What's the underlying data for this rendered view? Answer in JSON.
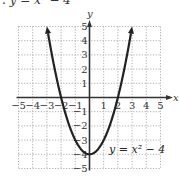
{
  "header": {
    "text": ". y = x² − 4"
  },
  "chart_data": {
    "type": "line",
    "title": "",
    "equation": "y = x² − 4",
    "xlabel": "x",
    "ylabel": "y",
    "xlim": [
      -5,
      5
    ],
    "ylim": [
      -5,
      5
    ],
    "grid": true,
    "x_ticks": [
      "-5",
      "-4",
      "-3",
      "-2",
      "-1",
      "1",
      "2",
      "3",
      "4",
      "5"
    ],
    "y_ticks": [
      "5",
      "4",
      "3",
      "2",
      "1",
      "-1",
      "-2",
      "-3",
      "-4",
      "-5"
    ],
    "series": [
      {
        "name": "y = x² − 4",
        "x": [
          -3,
          -2.5,
          -2,
          -1.5,
          -1,
          -0.5,
          0,
          0.5,
          1,
          1.5,
          2,
          2.5,
          3
        ],
        "y": [
          5,
          2.25,
          0,
          -1.75,
          -3,
          -3.75,
          -4,
          -3.75,
          -3,
          -1.75,
          0,
          2.25,
          5
        ],
        "arrows_at_ends": true
      }
    ]
  },
  "colors": {
    "curve": "#222222",
    "axis": "#333333",
    "grid": "#9a9a9a"
  }
}
